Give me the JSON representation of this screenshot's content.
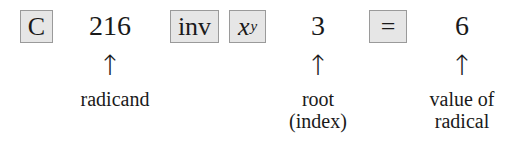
{
  "keys": {
    "clear": "C",
    "inverse": "inv",
    "power_base": "x",
    "power_exp": "y",
    "equals": "="
  },
  "values": {
    "radicand": "216",
    "root": "3",
    "result": "6"
  },
  "arrows": {
    "glyph": "↑"
  },
  "labels": {
    "radicand": "radicand",
    "root_line1": "root",
    "root_line2": "(index)",
    "result_line1": "value of",
    "result_line2": "radical"
  },
  "colors": {
    "key_fill": "#e6e6e6",
    "key_border": "#9a9a9a",
    "text": "#1a1a1a"
  }
}
